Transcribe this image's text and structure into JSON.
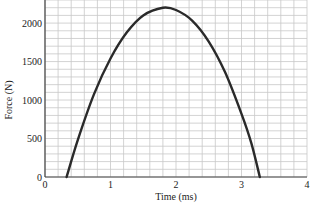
{
  "chart_data": {
    "type": "line",
    "title": "",
    "xlabel": "Time (ms)",
    "ylabel": "Force (N)",
    "xlim": [
      0,
      4
    ],
    "ylim": [
      0,
      2300
    ],
    "x_ticks": [
      0,
      1,
      2,
      3,
      4
    ],
    "x_tick_labels": [
      "0",
      "1",
      "2",
      "3",
      "4"
    ],
    "y_ticks": [
      0,
      500,
      1000,
      1500,
      2000
    ],
    "y_tick_labels": [
      "0",
      "500",
      "1000",
      "1500",
      "2000"
    ],
    "grid": true,
    "grid_minor_x": 0.2,
    "grid_minor_y": 100,
    "legend": null,
    "series": [
      {
        "name": "Force",
        "color": "#2a2a2a",
        "x": [
          0.33,
          0.5,
          0.75,
          1.0,
          1.25,
          1.5,
          1.8,
          2.0,
          2.25,
          2.5,
          2.75,
          3.0,
          3.15,
          3.28
        ],
        "y": [
          0,
          480,
          1080,
          1540,
          1880,
          2100,
          2200,
          2170,
          2030,
          1760,
          1360,
          820,
          440,
          0
        ]
      }
    ],
    "annotations": []
  },
  "labels": {
    "x_axis_title": "Time (ms)",
    "y_axis_title": "Force (N)",
    "x_ticks": [
      "0",
      "1",
      "2",
      "3",
      "4"
    ],
    "y_ticks": [
      "0",
      "500",
      "1000",
      "1500",
      "2000"
    ]
  },
  "colors": {
    "grid": "#c8c8c8",
    "axis": "#444444",
    "curve": "#2a2a2a",
    "background": "#ffffff"
  }
}
